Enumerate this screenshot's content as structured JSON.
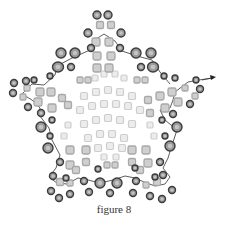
{
  "caption": "figure 8",
  "colors": {
    "outer_bead_fill": "#9a9a9a",
    "outer_bead_stroke": "#3c3c3c",
    "mid_bead_fill": "#cfcfcf",
    "mid_bead_stroke": "#a8a8a8",
    "inner_bead_fill": "#ececec",
    "inner_bead_stroke": "#cdcdcd",
    "thread": "#333333",
    "caption": "#333333"
  },
  "diagram": {
    "shape": "five-pointed star beadwork",
    "thread_path": [
      [
        212,
        78
      ],
      [
        199,
        80
      ],
      [
        188,
        82
      ],
      [
        175,
        92
      ],
      [
        173,
        100
      ],
      [
        170,
        108
      ],
      [
        160,
        110
      ],
      [
        165,
        120
      ],
      [
        177,
        130
      ],
      [
        172,
        145
      ],
      [
        168,
        158
      ],
      [
        163,
        168
      ],
      [
        170,
        177
      ],
      [
        165,
        184
      ],
      [
        155,
        186
      ],
      [
        144,
        182
      ],
      [
        135,
        178
      ],
      [
        125,
        176
      ],
      [
        113,
        180
      ],
      [
        100,
        183
      ],
      [
        88,
        180
      ],
      [
        78,
        178
      ],
      [
        67,
        184
      ],
      [
        57,
        183
      ],
      [
        49,
        177
      ],
      [
        56,
        168
      ],
      [
        60,
        155
      ],
      [
        52,
        140
      ],
      [
        49,
        128
      ],
      [
        40,
        116
      ],
      [
        40,
        108
      ],
      [
        32,
        100
      ],
      [
        22,
        94
      ],
      [
        32,
        84
      ],
      [
        44,
        85
      ],
      [
        55,
        75
      ],
      [
        57,
        66
      ],
      [
        72,
        58
      ],
      [
        90,
        50
      ],
      [
        93,
        41
      ],
      [
        104,
        34
      ],
      [
        115,
        41
      ],
      [
        122,
        51
      ],
      [
        137,
        56
      ],
      [
        152,
        60
      ],
      [
        160,
        72
      ],
      [
        170,
        84
      ]
    ],
    "outer_beads": [
      [
        97,
        15,
        4,
        4
      ],
      [
        108,
        15,
        4,
        4
      ],
      [
        88,
        33,
        4,
        4
      ],
      [
        121,
        33,
        4,
        4
      ],
      [
        91,
        48,
        3.5,
        3.5
      ],
      [
        120,
        48,
        3.5,
        3.5
      ],
      [
        61,
        53,
        5,
        5
      ],
      [
        75,
        53,
        5,
        5
      ],
      [
        136,
        53,
        5,
        5
      ],
      [
        151,
        53,
        5,
        5
      ],
      [
        58,
        67,
        5.5,
        5
      ],
      [
        153,
        67,
        5.5,
        5
      ],
      [
        71,
        67,
        3.5,
        3.5
      ],
      [
        141,
        67,
        3.5,
        3.5
      ],
      [
        50,
        76,
        3,
        3
      ],
      [
        164,
        76,
        3,
        3
      ],
      [
        175,
        78,
        3,
        3
      ],
      [
        196,
        80,
        3,
        3
      ],
      [
        14,
        83,
        3.5,
        3.5
      ],
      [
        26,
        81,
        3.5,
        3.5
      ],
      [
        34,
        80,
        3,
        3
      ],
      [
        13,
        93,
        3.5,
        3.5
      ],
      [
        200,
        89,
        3.5,
        3.5
      ],
      [
        28,
        107,
        3.5,
        3.5
      ],
      [
        190,
        104,
        3.5,
        3.5
      ],
      [
        41,
        113,
        3.5,
        3.5
      ],
      [
        173,
        114,
        3.5,
        3.5
      ],
      [
        52,
        120,
        3,
        3
      ],
      [
        162,
        120,
        3,
        3
      ],
      [
        41,
        127,
        5,
        5
      ],
      [
        177,
        127,
        5,
        5
      ],
      [
        50,
        136,
        3,
        3
      ],
      [
        165,
        136,
        3,
        3
      ],
      [
        48,
        148,
        5,
        5
      ],
      [
        170,
        146,
        5,
        5
      ],
      [
        60,
        162,
        3.5,
        3.5
      ],
      [
        160,
        162,
        3.5,
        3.5
      ],
      [
        53,
        176,
        3.5,
        3.5
      ],
      [
        163,
        175,
        3.5,
        3.5
      ],
      [
        51,
        191,
        3.5,
        3.5
      ],
      [
        172,
        190,
        3.5,
        3.5
      ],
      [
        59,
        198,
        3.5,
        3.5
      ],
      [
        162,
        199,
        3.5,
        3.5
      ],
      [
        70,
        194,
        3.5,
        3.5
      ],
      [
        150,
        196,
        3.5,
        3.5
      ],
      [
        84,
        181,
        3.5,
        3.5
      ],
      [
        136,
        181,
        3.5,
        3.5
      ],
      [
        100,
        183,
        5,
        5
      ],
      [
        117,
        183,
        5,
        5
      ],
      [
        110,
        193,
        3.5,
        3.5
      ],
      [
        89,
        192,
        3.5,
        3.5
      ],
      [
        133,
        193,
        3.5,
        3.5
      ],
      [
        66,
        178,
        3,
        3
      ],
      [
        155,
        177,
        3,
        3
      ],
      [
        98,
        169,
        3,
        3
      ],
      [
        135,
        168,
        3,
        3
      ]
    ],
    "mid_beads": [
      [
        100,
        25,
        3.5
      ],
      [
        111,
        25,
        3.5
      ],
      [
        96,
        42,
        4
      ],
      [
        109,
        42,
        4
      ],
      [
        97,
        56,
        4
      ],
      [
        111,
        56,
        4
      ],
      [
        97,
        68,
        4
      ],
      [
        109,
        68,
        4
      ],
      [
        80,
        80,
        3
      ],
      [
        88,
        80,
        3
      ],
      [
        137,
        80,
        3
      ],
      [
        145,
        80,
        3
      ],
      [
        27,
        88,
        3
      ],
      [
        40,
        92,
        4
      ],
      [
        51,
        92,
        4
      ],
      [
        62,
        98,
        3.5
      ],
      [
        23,
        97,
        3
      ],
      [
        38,
        102,
        4
      ],
      [
        52,
        108,
        4
      ],
      [
        68,
        105,
        3.5
      ],
      [
        185,
        88,
        3
      ],
      [
        172,
        92,
        4
      ],
      [
        160,
        96,
        4
      ],
      [
        148,
        100,
        3.5
      ],
      [
        195,
        96,
        3
      ],
      [
        178,
        102,
        4
      ],
      [
        165,
        108,
        4
      ],
      [
        150,
        113,
        3.5
      ],
      [
        70,
        150,
        4
      ],
      [
        86,
        150,
        4
      ],
      [
        70,
        165,
        4
      ],
      [
        86,
        162,
        3.5
      ],
      [
        60,
        182,
        3.5
      ],
      [
        70,
        183,
        3
      ],
      [
        76,
        170,
        3.5
      ],
      [
        146,
        150,
        4
      ],
      [
        132,
        150,
        4
      ],
      [
        148,
        163,
        4
      ],
      [
        132,
        162,
        3.5
      ],
      [
        157,
        182,
        3.5
      ],
      [
        146,
        185,
        3
      ],
      [
        140,
        170,
        3.5
      ],
      [
        107,
        165,
        3
      ],
      [
        115,
        165,
        3
      ]
    ],
    "inner_beads": [
      [
        95,
        78,
        3
      ],
      [
        104,
        74,
        3
      ],
      [
        115,
        74,
        3
      ],
      [
        124,
        78,
        3
      ],
      [
        84,
        96,
        3.5
      ],
      [
        96,
        92,
        3.5
      ],
      [
        108,
        90,
        3.5
      ],
      [
        120,
        92,
        3.5
      ],
      [
        132,
        96,
        3.5
      ],
      [
        80,
        110,
        3.5
      ],
      [
        92,
        106,
        3.5
      ],
      [
        104,
        104,
        3.5
      ],
      [
        116,
        104,
        3.5
      ],
      [
        128,
        106,
        3.5
      ],
      [
        140,
        110,
        3.5
      ],
      [
        84,
        124,
        3.5
      ],
      [
        96,
        120,
        3.5
      ],
      [
        108,
        118,
        3.5
      ],
      [
        120,
        120,
        3.5
      ],
      [
        132,
        124,
        3.5
      ],
      [
        88,
        138,
        3.5
      ],
      [
        100,
        134,
        3.5
      ],
      [
        112,
        134,
        3.5
      ],
      [
        124,
        138,
        3.5
      ],
      [
        68,
        125,
        3
      ],
      [
        64,
        136,
        3
      ],
      [
        150,
        125,
        3
      ],
      [
        154,
        136,
        3
      ],
      [
        98,
        148,
        3.5
      ],
      [
        110,
        146,
        3.5
      ],
      [
        122,
        148,
        3.5
      ],
      [
        104,
        157,
        3
      ],
      [
        116,
        157,
        3
      ]
    ],
    "arrow": {
      "x": 212,
      "y": 78
    }
  }
}
